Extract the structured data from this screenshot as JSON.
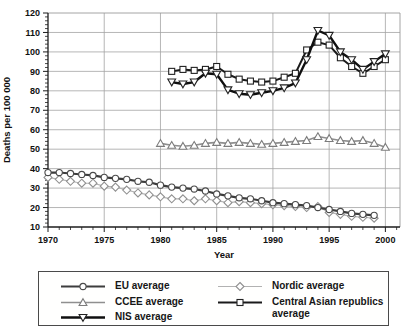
{
  "colors": {
    "background": "#ffffff",
    "grid": "#a3a3a3",
    "frame": "#9a9a9a",
    "axis": "#1c1c1c",
    "text": "#111111",
    "marker_fill": "#ffffff"
  },
  "chart_data": {
    "type": "line",
    "title": "",
    "xlabel": "Year",
    "ylabel": "Deaths per 100 000",
    "xlim": [
      1970,
      2001.3
    ],
    "ylim": [
      10,
      120
    ],
    "x_major_ticks": [
      1970,
      1975,
      1980,
      1985,
      1990,
      1995,
      2000
    ],
    "y_major_ticks": [
      10,
      20,
      30,
      40,
      50,
      60,
      70,
      80,
      90,
      100,
      110,
      120
    ],
    "x_minor_step": 1,
    "y_minor_step": 2,
    "grid": true,
    "legend_position": "bottom",
    "series": [
      {
        "name": "EU average",
        "marker": "circle",
        "color": "#3d3d3d",
        "marker_stroke": "#4a4a4a",
        "line_width": 2.2,
        "x_start": 1970,
        "values": [
          38,
          38,
          37.5,
          37,
          36.5,
          35.5,
          35,
          34.5,
          33.5,
          33,
          31.5,
          30.5,
          30,
          29.5,
          28.5,
          27,
          26,
          25,
          24.5,
          23.5,
          22.5,
          22,
          21.5,
          21,
          20,
          19,
          18,
          17,
          16.5,
          16
        ]
      },
      {
        "name": "CCEE average",
        "marker": "triangle-up",
        "color": "#8f8f8f",
        "marker_stroke": "#7c7c7c",
        "line_width": 1.6,
        "x_start": 1980,
        "values": [
          53,
          52,
          51.5,
          52,
          53,
          53.5,
          53,
          53.5,
          53,
          52.5,
          53,
          53.5,
          54,
          54.5,
          56.5,
          55.5,
          54.5,
          54,
          54.5,
          53,
          51
        ]
      },
      {
        "name": "NIS average",
        "marker": "triangle-down",
        "color": "#0f0f0f",
        "marker_stroke": "#222222",
        "line_width": 2.4,
        "x_start": 1981,
        "values": [
          84.5,
          83.5,
          84.5,
          89,
          88.5,
          80.5,
          78.5,
          78,
          79,
          80,
          81.5,
          84,
          96,
          111,
          108.5,
          100,
          96,
          91,
          95,
          99
        ]
      },
      {
        "name": "Nordic average",
        "marker": "diamond",
        "color": "#b2b2b2",
        "marker_stroke": "#909090",
        "line_width": 1.2,
        "x_start": 1970,
        "values": [
          35.5,
          34.5,
          33.5,
          32.5,
          32.5,
          31,
          30.5,
          29,
          27.5,
          26.5,
          25.5,
          24.5,
          24.5,
          23.5,
          24.5,
          23.5,
          22.5,
          23,
          22.5,
          22,
          21.5,
          21,
          20.5,
          20,
          20.5,
          17.5,
          16.5,
          15.5,
          15,
          14.5
        ]
      },
      {
        "name": "Central Asian republics average",
        "marker": "square",
        "color": "#1a1a1a",
        "marker_stroke": "#222222",
        "line_width": 2.0,
        "x_start": 1981,
        "values": [
          90,
          91,
          90.5,
          91,
          92.5,
          88.5,
          86,
          85,
          84.5,
          85,
          87,
          89,
          101,
          105,
          103.5,
          97,
          92.5,
          89,
          92.5,
          96
        ]
      }
    ],
    "draw_order": [
      3,
      0,
      1,
      4,
      2
    ],
    "legend_columns": [
      [
        0,
        1,
        2
      ],
      [
        3,
        4
      ]
    ]
  }
}
